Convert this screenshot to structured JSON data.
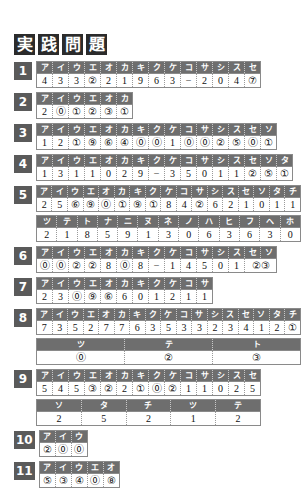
{
  "page": {
    "title_chars": [
      "実",
      "践",
      "問",
      "題"
    ],
    "title_text": "実践問題"
  },
  "questions": [
    {
      "number": "1",
      "tables": [
        {
          "headers": [
            "ア",
            "イ",
            "ウ",
            "エ",
            "オ",
            "カ",
            "キ",
            "ク",
            "ケ",
            "コ",
            "サ",
            "シ",
            "ス",
            "セ"
          ],
          "values": [
            "4",
            "3",
            "3",
            "②",
            "2",
            "1",
            "9",
            "6",
            "3",
            "−",
            "2",
            "0",
            "4",
            "⑦"
          ]
        }
      ]
    },
    {
      "number": "2",
      "tables": [
        {
          "headers": [
            "ア",
            "イ",
            "ウ",
            "エ",
            "オ",
            "カ"
          ],
          "values": [
            "2",
            "⓪",
            "①",
            "②",
            "③",
            "①"
          ]
        }
      ]
    },
    {
      "number": "3",
      "tables": [
        {
          "headers": [
            "ア",
            "イ",
            "ウ",
            "エ",
            "オ",
            "カ",
            "キ",
            "ク",
            "ケ",
            "コ",
            "サ",
            "シ",
            "ス",
            "セ",
            "ソ"
          ],
          "values": [
            "1",
            "2",
            "①",
            "⑨",
            "⑥",
            "④",
            "⓪",
            "⓪",
            "1",
            "⓪",
            "⓪",
            "②",
            "⑤",
            "⓪",
            "①"
          ]
        }
      ]
    },
    {
      "number": "4",
      "tables": [
        {
          "headers": [
            "ア",
            "イ",
            "ウ",
            "エ",
            "オ",
            "カ",
            "キ",
            "ク",
            "ケ",
            "コ",
            "サ",
            "シ",
            "ス",
            "セ",
            "ソ",
            "タ"
          ],
          "values": [
            "1",
            "3",
            "1",
            "1",
            "0",
            "2",
            "9",
            "−",
            "3",
            "5",
            "0",
            "1",
            "1",
            "②",
            "⑤",
            "①"
          ]
        }
      ]
    },
    {
      "number": "5",
      "tables": [
        {
          "headers": [
            "ア",
            "イ",
            "ウ",
            "エ",
            "オ",
            "カ",
            "キ",
            "ク",
            "ケ",
            "コ",
            "サ",
            "シ",
            "ス",
            "セ",
            "ソ",
            "タ",
            "チ"
          ],
          "values": [
            "2",
            "5",
            "⑥",
            "⑨",
            "⓪",
            "①",
            "⑨",
            "①",
            "8",
            "4",
            "②",
            "6",
            "2",
            "1",
            "0",
            "1",
            "1"
          ]
        },
        {
          "headers": [
            "ツ",
            "テ",
            "ト",
            "ナ",
            "ニ",
            "ヌ",
            "ネ",
            "ノ",
            "ハ",
            "ヒ",
            "フ",
            "ヘ",
            "ホ"
          ],
          "values": [
            "2",
            "1",
            "8",
            "5",
            "9",
            "1",
            "3",
            "0",
            "6",
            "3",
            "6",
            "3",
            "0"
          ]
        }
      ]
    },
    {
      "number": "6",
      "tables": [
        {
          "headers": [
            "ア",
            "イ",
            "ウ",
            "エ",
            "オ",
            "カ",
            "キ",
            "ク",
            "ケ",
            "コ",
            "サ",
            "シ",
            "ス",
            "セ",
            "ソ"
          ],
          "values": [
            "⓪",
            "⓪",
            "②",
            "②",
            "8",
            "⓪",
            "8",
            "−",
            "1",
            "4",
            "5",
            "0",
            "1",
            "②③"
          ]
        }
      ]
    },
    {
      "number": "7",
      "tables": [
        {
          "headers": [
            "ア",
            "イ",
            "ウ",
            "エ",
            "オ",
            "カ",
            "キ",
            "ク",
            "ケ",
            "コ",
            "サ"
          ],
          "values": [
            "2",
            "3",
            "⓪",
            "⑨",
            "⑥",
            "6",
            "0",
            "1",
            "2",
            "1",
            "1"
          ]
        }
      ]
    },
    {
      "number": "8",
      "tables": [
        {
          "headers": [
            "ア",
            "イ",
            "ウ",
            "エ",
            "オ",
            "カ",
            "キ",
            "ク",
            "ケ",
            "コ",
            "サ",
            "シ",
            "ス",
            "セ",
            "ソ",
            "タ",
            "チ"
          ],
          "values": [
            "7",
            "3",
            "5",
            "2",
            "7",
            "7",
            "6",
            "3",
            "5",
            "3",
            "3",
            "2",
            "3",
            "4",
            "1",
            "2",
            "①"
          ]
        },
        {
          "headers": [
            "ツ",
            "テ",
            "ト"
          ],
          "values": [
            "⓪",
            "②",
            "③"
          ]
        }
      ]
    },
    {
      "number": "9",
      "tables": [
        {
          "headers": [
            "ア",
            "イ",
            "ウ",
            "エ",
            "オ",
            "カ",
            "キ",
            "ク",
            "ケ",
            "コ",
            "サ",
            "シ",
            "ス",
            "セ"
          ],
          "values": [
            "5",
            "4",
            "5",
            "③",
            "②",
            "2",
            "①",
            "⓪",
            "②",
            "1",
            "1",
            "0",
            "2",
            "5"
          ]
        },
        {
          "headers": [
            "ソ",
            "タ",
            "チ",
            "ツ",
            "テ"
          ],
          "values": [
            "2",
            "5",
            "2",
            "1",
            "2"
          ]
        }
      ]
    },
    {
      "number": "10",
      "tables": [
        {
          "headers": [
            "ア",
            "イ",
            "ウ"
          ],
          "values": [
            "②",
            "⓪",
            "⓪"
          ]
        }
      ]
    },
    {
      "number": "11",
      "tables": [
        {
          "headers": [
            "ア",
            "イ",
            "ウ",
            "エ",
            "オ"
          ],
          "values": [
            "⑤",
            "③",
            "④",
            "⓪",
            "⑧"
          ]
        }
      ]
    }
  ],
  "colors": {
    "title_box": "#2b2b2b",
    "qnum_box": "#5a5a5a",
    "header_row": "#6e6e6e",
    "cell_bg": "#ffffff",
    "text": "#111111",
    "border": "#8a8a8a"
  }
}
